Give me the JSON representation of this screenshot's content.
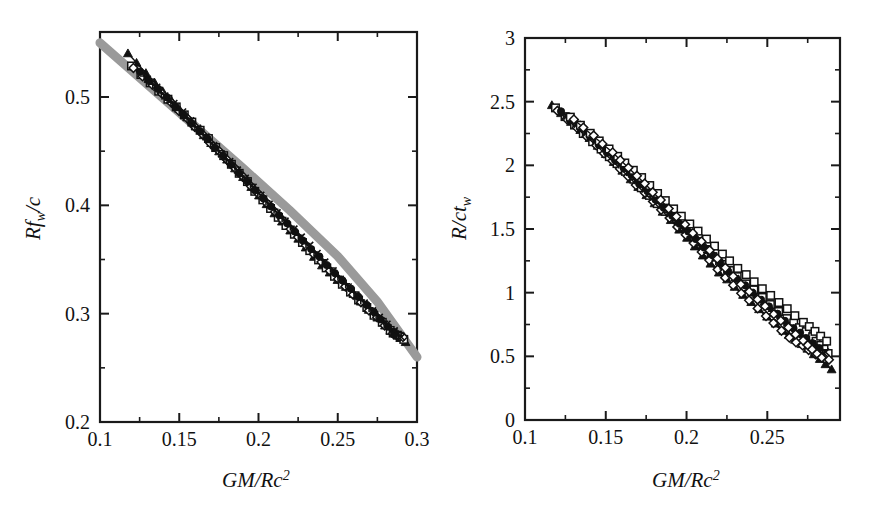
{
  "figure": {
    "background": "#ffffff",
    "accent_band_color": "#9a9a9a",
    "data_color": "#111111"
  },
  "chart_data": [
    {
      "panel": "left",
      "type": "scatter",
      "title": "",
      "xlabel": "GM/Rc2",
      "xlabel_parts": {
        "lead": "GM/Rc",
        "sup": "2"
      },
      "ylabel": "Rfw/c",
      "ylabel_parts": {
        "lead": "Rf",
        "sub": "w",
        "tail": "/c"
      },
      "xlim": [
        0.1,
        0.3
      ],
      "ylim": [
        0.2,
        0.56
      ],
      "xticks": [
        0.1,
        0.15,
        0.2,
        0.25,
        0.3
      ],
      "xticklabels": [
        "0.1",
        "0.15",
        "0.2",
        "0.25",
        "0.3"
      ],
      "xminor": [
        0.125,
        0.175,
        0.225,
        0.275
      ],
      "yticks": [
        0.2,
        0.3,
        0.4,
        0.5
      ],
      "yticklabels": [
        "0.2",
        "0.3",
        "0.4",
        "0.5"
      ],
      "yminor": [
        0.25,
        0.35,
        0.45
      ],
      "grid": false,
      "legend": "none",
      "band": {
        "name": "empirical-fit-band",
        "color": "#9a9a9a",
        "x": [
          0.1,
          0.13,
          0.16,
          0.19,
          0.22,
          0.25,
          0.275,
          0.3
        ],
        "y": [
          0.55,
          0.5115,
          0.473,
          0.4345,
          0.395,
          0.353,
          0.311,
          0.26
        ]
      },
      "series": [
        {
          "name": "eos-A",
          "marker": "filled-triangle",
          "x": [
            0.118,
            0.14,
            0.16,
            0.18,
            0.2,
            0.22,
            0.24,
            0.26,
            0.28,
            0.293
          ],
          "y": [
            0.54,
            0.504,
            0.473,
            0.442,
            0.409,
            0.377,
            0.345,
            0.318,
            0.289,
            0.274
          ]
        },
        {
          "name": "eos-B",
          "marker": "open-square",
          "x": [
            0.12,
            0.143,
            0.163,
            0.183,
            0.203,
            0.223,
            0.243,
            0.263,
            0.283,
            0.292
          ],
          "y": [
            0.5285,
            0.4985,
            0.469,
            0.438,
            0.405,
            0.373,
            0.342,
            0.313,
            0.284,
            0.276
          ]
        },
        {
          "name": "eos-C",
          "marker": "open-diamond",
          "x": [
            0.121,
            0.145,
            0.165,
            0.185,
            0.205,
            0.225,
            0.245,
            0.265,
            0.285,
            0.291
          ],
          "y": [
            0.527,
            0.495,
            0.465,
            0.434,
            0.402,
            0.371,
            0.34,
            0.311,
            0.282,
            0.278
          ]
        },
        {
          "name": "eos-D",
          "marker": "filled-circle",
          "x": [
            0.125,
            0.148,
            0.168,
            0.188,
            0.208,
            0.228,
            0.248,
            0.268,
            0.286
          ],
          "y": [
            0.523,
            0.491,
            0.461,
            0.43,
            0.399,
            0.368,
            0.337,
            0.308,
            0.282
          ]
        },
        {
          "name": "eos-E",
          "marker": "plus",
          "x": [
            0.128,
            0.15,
            0.17,
            0.19,
            0.21,
            0.23,
            0.25,
            0.27,
            0.288
          ],
          "y": [
            0.519,
            0.488,
            0.458,
            0.427,
            0.396,
            0.365,
            0.335,
            0.305,
            0.28
          ]
        },
        {
          "name": "eos-F",
          "marker": "cross",
          "x": [
            0.13,
            0.152,
            0.172,
            0.192,
            0.212,
            0.232,
            0.252,
            0.272,
            0.29
          ],
          "y": [
            0.517,
            0.486,
            0.455,
            0.425,
            0.393,
            0.363,
            0.332,
            0.303,
            0.278
          ]
        }
      ]
    },
    {
      "panel": "right",
      "type": "scatter",
      "title": "",
      "xlabel": "GM/Rc2",
      "xlabel_parts": {
        "lead": "GM/Rc",
        "sup": "2"
      },
      "ylabel": "R/ctw",
      "ylabel_parts": {
        "lead": "R/ct",
        "sub": "w"
      },
      "xlim": [
        0.1,
        0.295
      ],
      "ylim": [
        0.0,
        3.0
      ],
      "xticks": [
        0.1,
        0.15,
        0.2,
        0.25
      ],
      "xticklabels": [
        "0.1",
        "0.15",
        "0.2",
        "0.25"
      ],
      "xminor": [
        0.125,
        0.175,
        0.225,
        0.275
      ],
      "yticks": [
        0,
        0.5,
        1,
        1.5,
        2,
        2.5,
        3
      ],
      "yticklabels": [
        "0",
        "0.5",
        "1",
        "1.5",
        "2",
        "2.5",
        "3"
      ],
      "yminor": [
        0.25,
        0.75,
        1.25,
        1.75,
        2.25,
        2.75
      ],
      "grid": false,
      "legend": "none",
      "series": [
        {
          "name": "eos-A",
          "marker": "filled-triangle",
          "x": [
            0.117,
            0.14,
            0.16,
            0.18,
            0.2,
            0.22,
            0.24,
            0.26,
            0.275,
            0.29
          ],
          "y": [
            2.47,
            2.21,
            1.96,
            1.7,
            1.43,
            1.16,
            0.93,
            0.7,
            0.56,
            0.4
          ]
        },
        {
          "name": "eos-B",
          "marker": "open-square",
          "x": [
            0.119,
            0.142,
            0.162,
            0.182,
            0.202,
            0.222,
            0.242,
            0.262,
            0.278,
            0.288
          ],
          "y": [
            2.45,
            2.19,
            1.95,
            1.7,
            1.46,
            1.22,
            1.02,
            0.8,
            0.65,
            0.52
          ]
        },
        {
          "name": "eos-C",
          "marker": "open-diamond",
          "x": [
            0.12,
            0.144,
            0.164,
            0.184,
            0.204,
            0.224,
            0.244,
            0.264,
            0.28,
            0.288
          ],
          "y": [
            2.43,
            2.16,
            1.91,
            1.65,
            1.39,
            1.12,
            0.88,
            0.65,
            0.52,
            0.47
          ]
        },
        {
          "name": "eos-D",
          "marker": "filled-circle",
          "x": [
            0.122,
            0.146,
            0.166,
            0.186,
            0.206,
            0.226,
            0.246,
            0.266,
            0.282
          ],
          "y": [
            2.42,
            2.16,
            1.92,
            1.67,
            1.42,
            1.17,
            0.94,
            0.72,
            0.57
          ]
        },
        {
          "name": "eos-E",
          "marker": "plus",
          "x": [
            0.124,
            0.148,
            0.168,
            0.188,
            0.208,
            0.228,
            0.248,
            0.268,
            0.284
          ],
          "y": [
            2.4,
            2.14,
            1.89,
            1.63,
            1.37,
            1.13,
            0.91,
            0.69,
            0.55
          ]
        },
        {
          "name": "eos-F",
          "marker": "cross",
          "x": [
            0.126,
            0.15,
            0.17,
            0.19,
            0.21,
            0.23,
            0.25,
            0.27,
            0.286
          ],
          "y": [
            2.39,
            2.13,
            1.88,
            1.62,
            1.36,
            1.11,
            0.89,
            0.67,
            0.53
          ]
        },
        {
          "name": "eos-G",
          "marker": "open-square",
          "x": [
            0.128,
            0.152,
            0.172,
            0.192,
            0.212,
            0.232,
            0.252,
            0.272,
            0.287
          ],
          "y": [
            2.38,
            2.13,
            1.9,
            1.66,
            1.42,
            1.19,
            0.98,
            0.77,
            0.62
          ]
        },
        {
          "name": "eos-H",
          "marker": "open-diamond",
          "x": [
            0.13,
            0.154,
            0.174,
            0.194,
            0.214,
            0.234,
            0.254,
            0.272,
            0.284
          ],
          "y": [
            2.36,
            2.1,
            1.86,
            1.6,
            1.33,
            1.07,
            0.83,
            0.62,
            0.49
          ]
        }
      ]
    }
  ]
}
